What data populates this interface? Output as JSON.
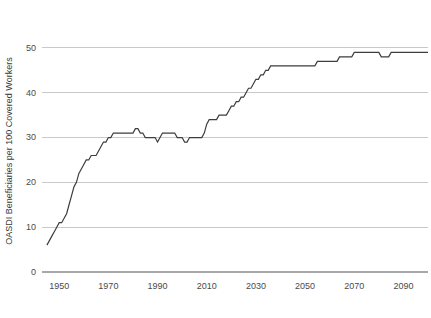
{
  "chart_data": {
    "type": "line",
    "title": "",
    "subtitle": "",
    "xlabel": "",
    "ylabel": "OASDI Beneficiaries per 100 Covered Workers",
    "xlim": [
      1943,
      2100
    ],
    "ylim": [
      0,
      54
    ],
    "grid": true,
    "grid_axis": "y",
    "legend": "none",
    "line_color": "#3d3d3d",
    "grid_color": "#c9c9c9",
    "axis_color": "#a8a8a8",
    "ytick_labels": [
      "0",
      "10",
      "20",
      "30",
      "40",
      "50"
    ],
    "ytick_values": [
      0,
      10,
      20,
      30,
      40,
      50
    ],
    "xtick_labels": [
      "1950",
      "1970",
      "1990",
      "2010",
      "2030",
      "2050",
      "2070",
      "2090"
    ],
    "xtick_values": [
      1950,
      1970,
      1990,
      2010,
      2030,
      2050,
      2070,
      2090
    ],
    "series": [
      {
        "name": "OASDI beneficiaries per 100 covered workers",
        "x": [
          1945,
          1946,
          1947,
          1948,
          1949,
          1950,
          1951,
          1952,
          1953,
          1954,
          1955,
          1956,
          1957,
          1958,
          1959,
          1960,
          1961,
          1962,
          1963,
          1964,
          1965,
          1966,
          1967,
          1968,
          1969,
          1970,
          1971,
          1972,
          1973,
          1974,
          1975,
          1976,
          1977,
          1978,
          1979,
          1980,
          1981,
          1982,
          1983,
          1984,
          1985,
          1986,
          1987,
          1988,
          1989,
          1990,
          1991,
          1992,
          1993,
          1994,
          1995,
          1996,
          1997,
          1998,
          1999,
          2000,
          2001,
          2002,
          2003,
          2004,
          2005,
          2006,
          2007,
          2008,
          2009,
          2010,
          2011,
          2012,
          2013,
          2014,
          2015,
          2016,
          2017,
          2018,
          2019,
          2020,
          2021,
          2022,
          2023,
          2024,
          2025,
          2026,
          2027,
          2028,
          2029,
          2030,
          2031,
          2032,
          2033,
          2034,
          2035,
          2036,
          2037,
          2038,
          2039,
          2040,
          2041,
          2042,
          2043,
          2044,
          2045,
          2046,
          2047,
          2048,
          2049,
          2050,
          2051,
          2052,
          2053,
          2054,
          2055,
          2056,
          2057,
          2058,
          2059,
          2060,
          2061,
          2062,
          2063,
          2064,
          2065,
          2066,
          2067,
          2068,
          2069,
          2070,
          2071,
          2072,
          2073,
          2074,
          2075,
          2076,
          2077,
          2078,
          2079,
          2080,
          2081,
          2082,
          2083,
          2084,
          2085,
          2086,
          2087,
          2088,
          2089,
          2090,
          2091,
          2092,
          2093,
          2094,
          2095,
          2096,
          2097,
          2098,
          2099,
          2100
        ],
        "values": [
          6,
          7,
          8,
          9,
          10,
          11,
          11,
          12,
          13,
          15,
          17,
          19,
          20,
          22,
          23,
          24,
          25,
          25,
          26,
          26,
          26,
          27,
          28,
          29,
          29,
          30,
          30,
          31,
          31,
          31,
          31,
          31,
          31,
          31,
          31,
          31,
          32,
          32,
          31,
          31,
          30,
          30,
          30,
          30,
          30,
          29,
          30,
          31,
          31,
          31,
          31,
          31,
          31,
          30,
          30,
          30,
          29,
          29,
          30,
          30,
          30,
          30,
          30,
          30,
          31,
          33,
          34,
          34,
          34,
          34,
          35,
          35,
          35,
          35,
          36,
          37,
          37,
          38,
          38,
          39,
          39,
          40,
          41,
          41,
          42,
          43,
          43,
          44,
          44,
          45,
          45,
          46,
          46,
          46,
          46,
          46,
          46,
          46,
          46,
          46,
          46,
          46,
          46,
          46,
          46,
          46,
          46,
          46,
          46,
          46,
          47,
          47,
          47,
          47,
          47,
          47,
          47,
          47,
          47,
          48,
          48,
          48,
          48,
          48,
          48,
          49,
          49,
          49,
          49,
          49,
          49,
          49,
          49,
          49,
          49,
          49,
          48,
          48,
          48,
          48,
          49,
          49,
          49,
          49,
          49,
          49,
          49,
          49,
          49,
          49,
          49,
          49,
          49,
          49,
          49,
          49
        ]
      }
    ]
  }
}
